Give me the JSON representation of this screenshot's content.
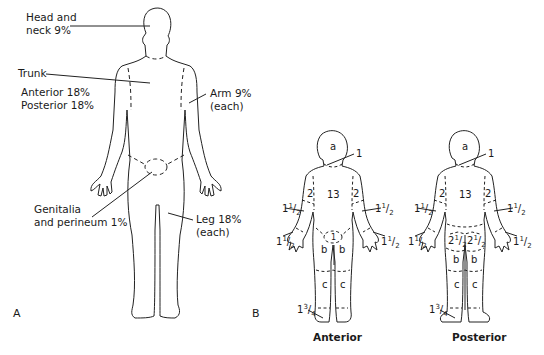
{
  "panel_a": {
    "letter": "A",
    "labels": {
      "head_line1": "Head and",
      "head_line2": "neck 9%",
      "trunk": "Trunk",
      "trunk_anterior": "Anterior 18%",
      "trunk_posterior": "Posterior 18%",
      "arm_line1": "Arm 9%",
      "arm_line2": "(each)",
      "genitalia_line1": "Genitalia",
      "genitalia_line2": "and perineum 1%",
      "leg_line1": "Leg 18%",
      "leg_line2": "(each)"
    }
  },
  "panel_b": {
    "letter": "B",
    "anterior": {
      "caption": "Anterior",
      "head": "a",
      "neck": "1",
      "trunk": "13",
      "upper_arm_left": "2",
      "upper_arm_right": "2",
      "forearm": "1½",
      "hand": "1½",
      "genitalia": "1",
      "thigh": "b",
      "lower_leg": "c",
      "foot": "1¾"
    },
    "posterior": {
      "caption": "Posterior",
      "head": "a",
      "neck": "1",
      "trunk": "13",
      "upper_arm_left": "2",
      "upper_arm_right": "2",
      "forearm": "1½",
      "hand": "1½",
      "buttock": "2½",
      "thigh": "b",
      "lower_leg": "c",
      "foot": "1¾"
    }
  },
  "frac": {
    "whole1": "1",
    "half_num": "1",
    "half_den": "2",
    "whole2": "2",
    "q_num": "3",
    "q_den": "4"
  }
}
